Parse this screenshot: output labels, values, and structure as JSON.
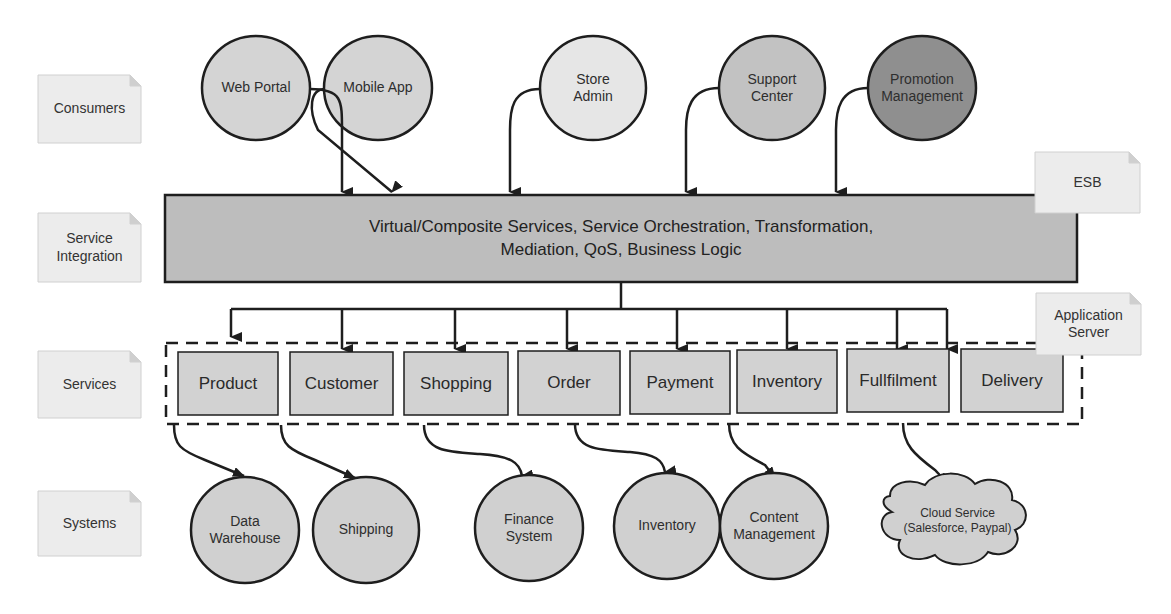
{
  "layers": {
    "consumers": "Consumers",
    "service_integration": "Service\nIntegration",
    "services": "Services",
    "systems": "Systems"
  },
  "notes": {
    "esb": "ESB",
    "app_server": "Application\nServer"
  },
  "consumers": [
    {
      "label": "Web Portal",
      "fill": "#d4d4d4"
    },
    {
      "label": "Mobile App",
      "fill": "#d4d4d4"
    },
    {
      "label": "Store\nAdmin",
      "fill": "#e6e6e6"
    },
    {
      "label": "Support\nCenter",
      "fill": "#c2c2c2"
    },
    {
      "label": "Promotion\nManagement",
      "fill": "#8f8f8f"
    }
  ],
  "esb_box": {
    "text": "Virtual/Composite Services, Service Orchestration, Transformation,\nMediation, QoS, Business Logic",
    "fill": "#bdbdbd"
  },
  "services": [
    {
      "label": "Product"
    },
    {
      "label": "Customer"
    },
    {
      "label": "Shopping"
    },
    {
      "label": "Order"
    },
    {
      "label": "Payment"
    },
    {
      "label": "Inventory"
    },
    {
      "label": "Fullfilment"
    },
    {
      "label": "Delivery"
    }
  ],
  "systems": [
    {
      "label": "Data\nWarehouse"
    },
    {
      "label": "Shipping"
    },
    {
      "label": "Finance\nSystem"
    },
    {
      "label": "Inventory"
    },
    {
      "label": "Content\nManagement"
    },
    {
      "label": "Cloud Service\n(Salesforce, Paypal)"
    }
  ],
  "colors": {
    "stroke": "#1e1e1e",
    "note_fill": "#ececec",
    "service_fill": "#d2d2d2",
    "system_fill": "#d0d0d0"
  }
}
